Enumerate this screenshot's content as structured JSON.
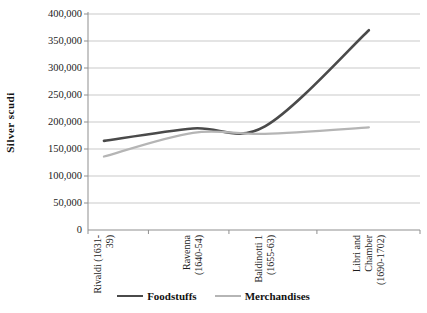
{
  "figure": {
    "background": "#ffffff"
  },
  "chart_data": {
    "type": "line",
    "title": "",
    "xlabel": "",
    "ylabel": "Silver scudi",
    "categories": [
      {
        "label": "Rivaldi (1631-39)",
        "lines": [
          "Rivaldi (1631-",
          "39)"
        ]
      },
      {
        "label": "Ravenna (1640-54)",
        "lines": [
          "Ravenna",
          "(1640-54)"
        ]
      },
      {
        "label": "Baldinotti 1 (1655-63)",
        "lines": [
          "Baldinotti 1",
          "(1655-63)"
        ]
      },
      {
        "label": "Libri and Chamber (1690-1702)",
        "lines": [
          "Libri and",
          "Chamber",
          "(1690-1702)"
        ]
      }
    ],
    "series": [
      {
        "name": "Foodstuffs",
        "color": "#4a4a4a",
        "stroke_width": 2.6,
        "values": [
          165000,
          188000,
          192000,
          370000
        ]
      },
      {
        "name": "Merchandises",
        "color": "#b5b5b5",
        "stroke_width": 2.2,
        "values": [
          136000,
          180000,
          178000,
          190000
        ]
      }
    ],
    "ylim": [
      0,
      400000
    ],
    "ytick_step": 50000,
    "ytick_labels_top_to_bottom": [
      "400,000",
      "350,000",
      "300,000",
      "250,000",
      "200,000",
      "150,000",
      "100,000",
      "50,000",
      "0"
    ],
    "grid": true,
    "smooth": true,
    "legend_position": "bottom",
    "x_fractions": [
      0.048,
      0.316,
      0.533,
      0.846
    ],
    "colors": {
      "gridline": "#c9c9c9",
      "axis": "#8f8f8f",
      "text": "#1c1c1c"
    }
  }
}
